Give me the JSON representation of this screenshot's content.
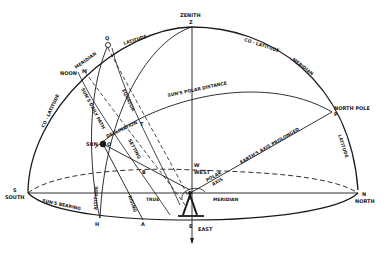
{
  "diagram": {
    "points": {
      "zenith": {
        "name": "ZENITH",
        "letter": "Z"
      },
      "north_pole": {
        "name": "NORTH POLE",
        "letter": "P"
      },
      "north": {
        "name": "NORTH",
        "letter": "N"
      },
      "south": {
        "name": "SOUTH",
        "letter": "S"
      },
      "east": {
        "name": "EAST",
        "letter": "E"
      },
      "west": {
        "name": "WEST",
        "letter": "W"
      },
      "sun": {
        "name": "SUN",
        "letter": "O"
      },
      "noon": {
        "name": "NOON",
        "letter": "M"
      },
      "q": {
        "letter": "Q"
      },
      "t": {
        "letter": "T"
      },
      "b": {
        "letter": "B"
      },
      "h": {
        "letter": "H"
      },
      "a": {
        "letter": "A"
      }
    },
    "arc_labels": {
      "meridian_left": "MERIDIAN",
      "latitude_top": "LATITUDE",
      "co_latitude_left": "CO - LATITUDE",
      "co_latitude_right": "CO - LATITUDE",
      "meridian_right": "MERIDIAN",
      "latitude_right": "LATITUDE",
      "suns_polar_distance": "SUN'S POLAR DISTANCE",
      "suns_daily_path": "SUN'S DAILY PATH",
      "equator": "EQUATOR",
      "declination": "DECLINATION",
      "setting": "SETTING",
      "rising": "RISING",
      "altitude": "ALTITUDE",
      "suns_bearing": "SUN'S BEARING",
      "true": "TRUE",
      "meridian_bottom": "MERIDIAN",
      "polar_axis": "POLAR",
      "polar_axis2": "AXIS",
      "earths_axis": "EARTH'S AXIS PROLONGED"
    }
  }
}
